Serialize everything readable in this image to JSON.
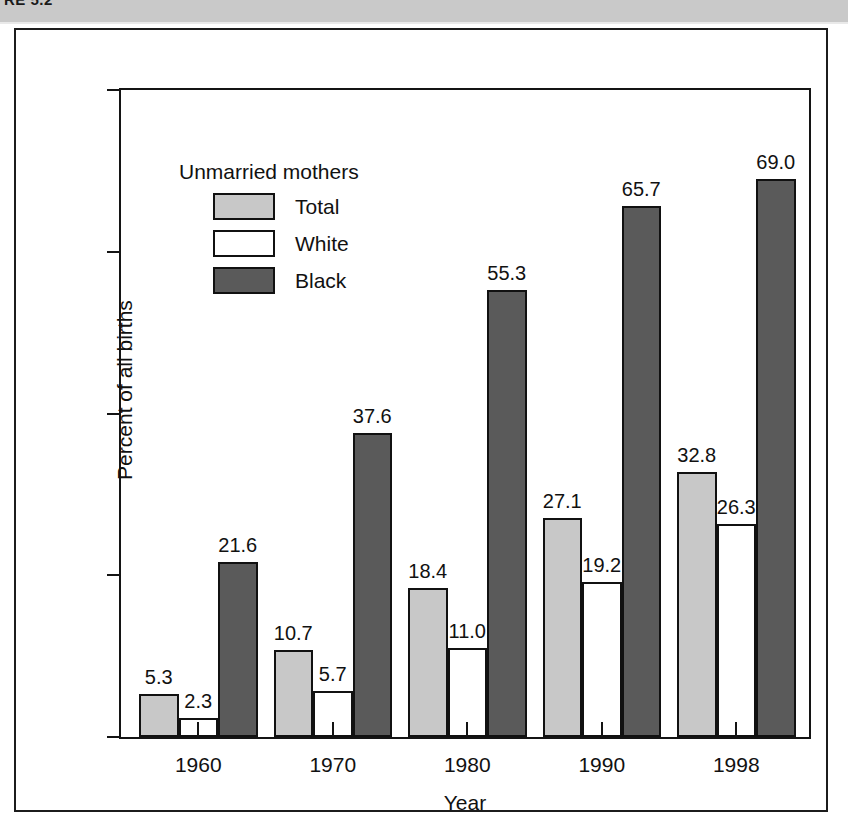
{
  "caption": {
    "figure_label": "RE 5.2",
    "figure_text": ""
  },
  "chart_data": {
    "type": "bar",
    "title": "",
    "subtitle": "",
    "xlabel": "Year",
    "ylabel": "Percent of all births",
    "categories": [
      "1960",
      "1970",
      "1980",
      "1990",
      "1998"
    ],
    "ylim": [
      0,
      80
    ],
    "yticks": [
      0,
      20,
      40,
      60,
      80
    ],
    "ytick_labels": [
      "0",
      "20",
      "40",
      "60",
      "80"
    ],
    "grid": false,
    "legend_title": "Unmarried mothers",
    "legend_position": "upper-left-inside",
    "series": [
      {
        "name": "Total",
        "color": "#c8c8c8",
        "values": [
          5.3,
          10.7,
          18.4,
          27.1,
          32.8
        ],
        "labels": [
          "5.3",
          "10.7",
          "18.4",
          "27.1",
          "32.8"
        ]
      },
      {
        "name": "White",
        "color": "#ffffff",
        "values": [
          2.3,
          5.7,
          11.0,
          19.2,
          26.3
        ],
        "labels": [
          "2.3",
          "5.7",
          "11.0",
          "19.2",
          "26.3"
        ]
      },
      {
        "name": "Black",
        "color": "#5a5a5a",
        "values": [
          21.6,
          37.6,
          55.3,
          65.7,
          69.0
        ],
        "labels": [
          "21.6",
          "37.6",
          "55.3",
          "65.7",
          "69.0"
        ]
      }
    ]
  },
  "colors": {
    "total": "#c8c8c8",
    "white": "#ffffff",
    "black": "#5a5a5a",
    "outline": "#111111",
    "caption_bar": "#c9c9c9"
  }
}
